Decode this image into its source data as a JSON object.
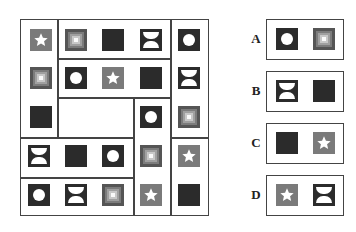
{
  "puzzle": {
    "grid": {
      "tiles": [
        {
          "shape": "star",
          "x": 30,
          "y": 29
        },
        {
          "shape": "concentric",
          "x": 30,
          "y": 67
        },
        {
          "shape": "black",
          "x": 30,
          "y": 106
        },
        {
          "shape": "concentric",
          "x": 65,
          "y": 29
        },
        {
          "shape": "black",
          "x": 102,
          "y": 29
        },
        {
          "shape": "hourglass",
          "x": 140,
          "y": 29
        },
        {
          "shape": "circle",
          "x": 65,
          "y": 67
        },
        {
          "shape": "star",
          "x": 102,
          "y": 67
        },
        {
          "shape": "black",
          "x": 140,
          "y": 67
        },
        {
          "shape": "circle",
          "x": 178,
          "y": 29
        },
        {
          "shape": "hourglass",
          "x": 178,
          "y": 67
        },
        {
          "shape": "concentric",
          "x": 178,
          "y": 106
        },
        {
          "shape": "star",
          "x": 178,
          "y": 145
        },
        {
          "shape": "black",
          "x": 178,
          "y": 184
        },
        {
          "shape": "circle",
          "x": 140,
          "y": 106
        },
        {
          "shape": "concentric",
          "x": 140,
          "y": 145
        },
        {
          "shape": "star",
          "x": 140,
          "y": 184
        },
        {
          "shape": "hourglass",
          "x": 28,
          "y": 145
        },
        {
          "shape": "black",
          "x": 65,
          "y": 145
        },
        {
          "shape": "circle",
          "x": 102,
          "y": 145
        },
        {
          "shape": "circle",
          "x": 28,
          "y": 184
        },
        {
          "shape": "hourglass",
          "x": 65,
          "y": 184
        },
        {
          "shape": "concentric",
          "x": 102,
          "y": 184
        }
      ],
      "empty_region": "blank cell (missing piece)"
    },
    "options": [
      {
        "label": "A",
        "tiles": [
          "circle",
          "concentric"
        ],
        "y": 19
      },
      {
        "label": "B",
        "tiles": [
          "hourglass",
          "black"
        ],
        "y": 71
      },
      {
        "label": "C",
        "tiles": [
          "black",
          "star"
        ],
        "y": 123
      },
      {
        "label": "D",
        "tiles": [
          "star",
          "hourglass"
        ],
        "y": 175
      }
    ]
  },
  "colors": {
    "frame": "#444444",
    "dark_tile": "#2b2b2b",
    "star_tile": "#7a7a7a",
    "concentric_outer": "#555555"
  }
}
